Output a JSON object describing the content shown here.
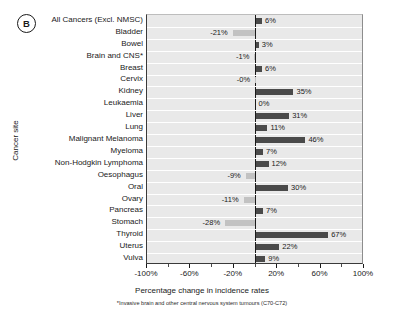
{
  "panel": {
    "label": "B"
  },
  "axes": {
    "y_title": "Cancer site",
    "x_title": "Percentage change in incidence rates",
    "footnote": "*Invasive brain and other central nervous system tumours (C70-C72)"
  },
  "colors": {
    "positive_bar": "#4a4a4a",
    "negative_bar": "#c2c2c2",
    "plot_background": "#e9e9e9",
    "gridline": "#ffffff",
    "axis": "#1a1a1a"
  },
  "chart_data": {
    "type": "bar",
    "orientation": "horizontal",
    "title": "",
    "xlabel": "Percentage change in incidence rates",
    "ylabel": "Cancer site",
    "xlim": [
      -100,
      100
    ],
    "xticks": [
      -100,
      -60,
      -20,
      20,
      60,
      100
    ],
    "xtick_labels": [
      "-100%",
      "-60%",
      "-20%",
      "20%",
      "60%",
      "100%"
    ],
    "grid": true,
    "legend": "none",
    "categories": [
      "All Cancers (Excl. NMSC)",
      "Bladder",
      "Bowel",
      "Brain and CNS*",
      "Breast",
      "Cervix",
      "Kidney",
      "Leukaemia",
      "Liver",
      "Lung",
      "Malignant Melanoma",
      "Myeloma",
      "Non-Hodgkin Lymphoma",
      "Oesophagus",
      "Oral",
      "Ovary",
      "Pancreas",
      "Stomach",
      "Thyroid",
      "Uterus",
      "Vulva"
    ],
    "values": [
      6,
      -21,
      3,
      -1,
      6,
      -0.4,
      35,
      0,
      31,
      11,
      46,
      7,
      12,
      -9,
      30,
      -11,
      7,
      -28,
      67,
      22,
      9
    ],
    "data_labels": [
      "6%",
      "-21%",
      "3%",
      "-1%",
      "6%",
      "-0%",
      "35%",
      "0%",
      "31%",
      "11%",
      "46%",
      "7%",
      "12%",
      "-9%",
      "30%",
      "-11%",
      "7%",
      "-28%",
      "67%",
      "22%",
      "9%"
    ]
  }
}
